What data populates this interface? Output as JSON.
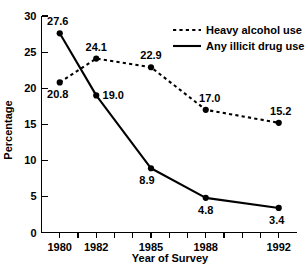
{
  "chart_data": {
    "type": "line",
    "title": "",
    "xlabel": "Year of Survey",
    "ylabel": "Percentage",
    "x": [
      1980,
      1982,
      1985,
      1988,
      1992
    ],
    "xtick_labels": [
      "1980",
      "1982",
      "1985",
      "1988",
      "1992"
    ],
    "xlim": [
      1979,
      1993
    ],
    "ylim": [
      0,
      30
    ],
    "ytick_labels": [
      "0",
      "5",
      "10",
      "15",
      "20",
      "25",
      "30"
    ],
    "yticks": [
      0,
      5,
      10,
      15,
      20,
      25,
      30
    ],
    "grid": false,
    "legend_position": "top-right",
    "minor_xticks": [
      1979,
      1980,
      1981,
      1982,
      1983,
      1984,
      1985,
      1986,
      1987,
      1988,
      1989,
      1990,
      1991,
      1992,
      1993
    ],
    "series": [
      {
        "name": "Heavy alcohol use",
        "style": "dashed",
        "values": [
          20.8,
          24.1,
          22.9,
          17.0,
          15.2
        ],
        "point_labels": [
          "20.8",
          "24.1",
          "22.9",
          "17.0",
          "15.2"
        ]
      },
      {
        "name": "Any illicit drug use",
        "style": "solid",
        "values": [
          27.6,
          19.0,
          8.9,
          4.8,
          3.4
        ],
        "point_labels": [
          "27.6",
          "19.0",
          "8.9",
          "4.8",
          "3.4"
        ]
      }
    ]
  },
  "legend": {
    "items": [
      {
        "label": "Heavy alcohol use",
        "style": "dashed"
      },
      {
        "label": "Any illicit drug use",
        "style": "solid"
      }
    ]
  },
  "axes": {
    "y_title": "Percentage",
    "x_title": "Year of Survey"
  },
  "labels": {
    "y_0": "0",
    "y_5": "5",
    "y_10": "10",
    "y_15": "15",
    "y_20": "20",
    "y_25": "25",
    "y_30": "30",
    "x_1980": "1980",
    "x_1982": "1982",
    "x_1985": "1985",
    "x_1988": "1988",
    "x_1992": "1992",
    "alcohol_1980": "20.8",
    "alcohol_1982": "24.1",
    "alcohol_1985": "22.9",
    "alcohol_1988": "17.0",
    "alcohol_1992": "15.2",
    "drug_1980": "27.6",
    "drug_1982": "19.0",
    "drug_1985": "8.9",
    "drug_1988": "4.8",
    "drug_1992": "3.4",
    "legend_alcohol": "Heavy alcohol use",
    "legend_drug": "Any illicit drug use"
  },
  "colors": {
    "ink": "#000000",
    "background": "#ffffff"
  }
}
